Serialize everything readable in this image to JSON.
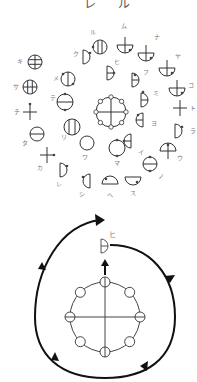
{
  "title": {
    "chars": [
      "レ",
      "ル"
    ]
  },
  "colors": {
    "stroke": "#333333",
    "label": "#777777",
    "arrow": "#111111",
    "dot": "#444444"
  },
  "upper_diagram": {
    "center_symbol": {
      "name": "center-wheel",
      "x": 111,
      "y": 112,
      "r": 15
    },
    "symbols": [
      {
        "label": "ル",
        "shape": "circle-vbars",
        "x": 100,
        "y": 47,
        "lx": 90,
        "ly": 34
      },
      {
        "label": "ム",
        "shape": "bowl-stem",
        "x": 125,
        "y": 45,
        "lx": 121,
        "ly": 28
      },
      {
        "label": "ナ",
        "shape": "bowl-stem",
        "x": 146,
        "y": 53,
        "lx": 154,
        "ly": 39
      },
      {
        "label": "ヤ",
        "shape": "bowl-stem",
        "x": 167,
        "y": 68,
        "lx": 175,
        "ly": 58
      },
      {
        "label": "コ",
        "shape": "bowl-stem",
        "x": 177,
        "y": 88,
        "lx": 188,
        "ly": 87
      },
      {
        "label": "ト",
        "shape": "cross",
        "x": 180,
        "y": 108,
        "lx": 190,
        "ly": 110
      },
      {
        "label": "ラ",
        "shape": "d-right",
        "x": 179,
        "y": 131,
        "lx": 190,
        "ly": 133
      },
      {
        "label": "ウ",
        "shape": "dome-stem",
        "x": 168,
        "y": 151,
        "lx": 177,
        "ly": 160
      },
      {
        "label": "ノ",
        "shape": "circle-hbar",
        "x": 150,
        "y": 164,
        "lx": 158,
        "ly": 178
      },
      {
        "label": "ス",
        "shape": "bowl",
        "x": 133,
        "y": 180,
        "lx": 130,
        "ly": 195
      },
      {
        "label": "ヘ",
        "shape": "dome",
        "x": 110,
        "y": 181,
        "lx": 107,
        "ly": 197
      },
      {
        "label": "シ",
        "shape": "d-left",
        "x": 86,
        "y": 181,
        "lx": 79,
        "ly": 196
      },
      {
        "label": "レ",
        "shape": "d-right",
        "x": 64,
        "y": 170,
        "lx": 56,
        "ly": 186
      },
      {
        "label": "カ",
        "shape": "cross",
        "x": 47,
        "y": 155,
        "lx": 37,
        "ly": 170
      },
      {
        "label": "タ",
        "shape": "circle-hbar",
        "x": 37,
        "y": 134,
        "lx": 22,
        "ly": 145
      },
      {
        "label": "チ",
        "shape": "cross",
        "x": 30,
        "y": 112,
        "lx": 14,
        "ly": 114
      },
      {
        "label": "サ",
        "shape": "circle-grid",
        "x": 30,
        "y": 87,
        "lx": 13,
        "ly": 89
      },
      {
        "label": "キ",
        "shape": "circle-hgrid",
        "x": 35,
        "y": 62,
        "lx": 17,
        "ly": 63
      },
      {
        "label": "メ",
        "shape": "circle-vbar",
        "x": 68,
        "y": 79,
        "lx": 53,
        "ly": 80
      },
      {
        "label": "ク",
        "shape": "d-right",
        "x": 87,
        "y": 57,
        "lx": 73,
        "ly": 56
      },
      {
        "label": "ヒ",
        "shape": "d-right",
        "x": 111,
        "y": 73,
        "lx": 114,
        "ly": 64
      },
      {
        "label": "フ",
        "shape": "d-right",
        "x": 136,
        "y": 80,
        "lx": 143,
        "ly": 74
      },
      {
        "label": "ミ",
        "shape": "d-right",
        "x": 145,
        "y": 100,
        "lx": 153,
        "ly": 95
      },
      {
        "label": "ヨ",
        "shape": "d-left",
        "x": 139,
        "y": 120,
        "lx": 151,
        "ly": 125
      },
      {
        "label": "イ",
        "shape": "d-left",
        "x": 127,
        "y": 141,
        "lx": 138,
        "ly": 154
      },
      {
        "label": "マ",
        "shape": "circle",
        "x": 117,
        "y": 148,
        "lx": 114,
        "ly": 165
      },
      {
        "label": "ワ",
        "shape": "circle",
        "x": 87,
        "y": 143,
        "lx": 82,
        "ly": 159
      },
      {
        "label": "リ",
        "shape": "circle-vbars",
        "x": 72,
        "y": 127,
        "lx": 61,
        "ly": 139
      },
      {
        "label": "テ",
        "shape": "circle-hbar",
        "x": 65,
        "y": 102,
        "lx": 50,
        "ly": 100
      }
    ]
  },
  "lower_diagram": {
    "wheel": {
      "x": 105,
      "y": 317,
      "r": 33
    },
    "target_symbol": {
      "label": "ヒ",
      "x": 105,
      "y": 246
    },
    "direction": "clockwise"
  }
}
